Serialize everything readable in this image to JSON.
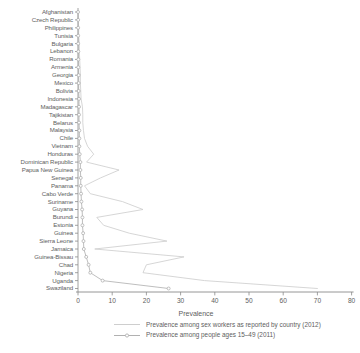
{
  "chart_data": {
    "type": "line",
    "title": "",
    "xlabel": "Prevalence",
    "ylabel": "",
    "xlim": [
      0,
      80
    ],
    "xticks": [
      0,
      10,
      20,
      30,
      40,
      50,
      60,
      70,
      80
    ],
    "xticklabels": [
      "0",
      "10",
      "20",
      "30",
      "40",
      "50",
      "60",
      "70",
      "80"
    ],
    "grid": false,
    "orientation": "horizontal",
    "legend_position": "bottom",
    "categories": [
      "Afghanistan",
      "Czech Republic",
      "Philippines",
      "Tunisia",
      "Bulgaria",
      "Lebanon",
      "Romania",
      "Armenia",
      "Georgia",
      "Mexico",
      "Bolivia",
      "Indonesia",
      "Madagascar",
      "Tajikistan",
      "Belarus",
      "Malaysia",
      "Chile",
      "Vietnam",
      "Honduras",
      "Dominican Republic",
      "Papua New Guinea",
      "Senegal",
      "Panama",
      "Cabo Verde",
      "Suriname",
      "Guyana",
      "Burundi",
      "Estonia",
      "Guinea",
      "Sierra Leone",
      "Jamaica",
      "Guinea-Bissau",
      "Chad",
      "Nigeria",
      "Uganda",
      "Swaziland"
    ],
    "series": [
      {
        "name": "Prevalence among sex workers as reported by country (2012)",
        "color": "#c8c8c8",
        "marker": "none",
        "values": [
          0.1,
          0.1,
          0.2,
          0.2,
          0.4,
          0.4,
          0.5,
          0.6,
          0.7,
          0.7,
          0.8,
          0.9,
          1.3,
          1.4,
          1.4,
          1.6,
          1.9,
          2.8,
          4.6,
          2.5,
          12.0,
          6.6,
          1.9,
          3.6,
          13.0,
          19.0,
          5.5,
          7.5,
          15.0,
          26.0,
          4.9,
          31.0,
          20.0,
          19.0,
          37.0,
          70.0
        ]
      },
      {
        "name": "Prevalence among people ages 15–49 (2011)",
        "color": "#a8a8a8",
        "marker": "circle",
        "values": [
          0.01,
          0.05,
          0.05,
          0.05,
          0.05,
          0.1,
          0.1,
          0.1,
          0.2,
          0.2,
          0.2,
          0.3,
          0.3,
          0.3,
          0.3,
          0.4,
          0.4,
          0.4,
          0.5,
          0.7,
          0.7,
          0.8,
          0.8,
          0.9,
          1.0,
          1.2,
          1.3,
          1.3,
          1.5,
          1.6,
          1.7,
          2.4,
          3.1,
          3.6,
          7.2,
          26.5
        ]
      }
    ]
  },
  "legend": {
    "items": [
      {
        "label": "Prevalence among sex workers as reported by country (2012)"
      },
      {
        "label": "Prevalence among people ages 15–49 (2011)"
      }
    ]
  }
}
